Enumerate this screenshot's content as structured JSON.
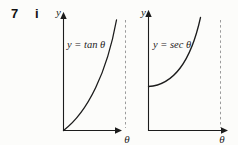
{
  "header": {
    "problem_number": "7",
    "part_label": "i"
  },
  "left_graph": {
    "curve_label": "y = tan θ",
    "y_axis_label": "y",
    "x_axis_label": "θ",
    "curve": "tan"
  },
  "right_graph": {
    "curve_label": "y = sec θ",
    "y_axis_label": "y",
    "x_axis_label": "θ",
    "curve": "sec"
  },
  "colors": {
    "ink": "#1c1c1c",
    "asymptote_dash": "#9b9b9b",
    "background": "#fcfcfa"
  }
}
